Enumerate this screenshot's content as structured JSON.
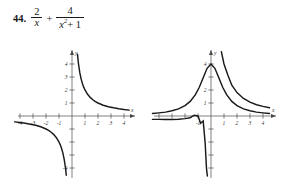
{
  "exercise": {
    "number": "44.",
    "expression_plain": "2/x + 4/(x^2 + 1)",
    "term_one": {
      "numerator": "2",
      "denominator": "x"
    },
    "operator": "+",
    "term_two": {
      "numerator": "4",
      "denominator_base": "x",
      "denominator_exp": "2",
      "denominator_tail": "+ 1"
    }
  },
  "chart_data": [
    {
      "id": "graph-one",
      "type": "line",
      "title": "",
      "xlabel": "x",
      "ylabel": "y",
      "xlim": [
        -4.6,
        4.6
      ],
      "ylim": [
        -4.6,
        4.8
      ],
      "xticks": [
        -4,
        -3,
        -2,
        -1,
        1,
        2,
        3,
        4
      ],
      "yticks": [
        1,
        2,
        3,
        4
      ],
      "xticklabels": [
        "-4",
        "-3",
        "-2",
        "-1",
        "1",
        "2",
        "3",
        "4"
      ],
      "yticklabels": [
        "1",
        "2",
        "3",
        "4"
      ],
      "neg_yticklabels": [
        "-4"
      ],
      "neg_yticks": [
        -4
      ],
      "grid": false,
      "legend": "none",
      "series": [
        {
          "name": "2/x (right branch)",
          "expression": "y = 2/x",
          "x": [
            0.42,
            0.5,
            0.6,
            0.7,
            0.8,
            0.9,
            1.0,
            1.2,
            1.4,
            1.6,
            1.8,
            2.0,
            2.4,
            2.8,
            3.2,
            3.6,
            4.0,
            4.4
          ],
          "y": [
            4.76,
            4.0,
            3.33,
            2.86,
            2.5,
            2.22,
            2.0,
            1.67,
            1.43,
            1.25,
            1.11,
            1.0,
            0.83,
            0.71,
            0.63,
            0.56,
            0.5,
            0.45
          ]
        },
        {
          "name": "2/x (left branch)",
          "expression": "y = 2/x",
          "x": [
            -4.4,
            -4.0,
            -3.6,
            -3.2,
            -2.8,
            -2.4,
            -2.0,
            -1.8,
            -1.6,
            -1.4,
            -1.2,
            -1.0,
            -0.9,
            -0.8,
            -0.7,
            -0.6,
            -0.5,
            -0.44
          ],
          "y": [
            -0.45,
            -0.5,
            -0.56,
            -0.63,
            -0.71,
            -0.83,
            -1.0,
            -1.11,
            -1.25,
            -1.43,
            -1.67,
            -2.0,
            -2.22,
            -2.5,
            -2.86,
            -3.33,
            -4.0,
            -4.55
          ]
        }
      ]
    },
    {
      "id": "graph-two",
      "type": "line",
      "title": "",
      "xlabel": "x",
      "ylabel": "y",
      "xlim": [
        -4.6,
        4.6
      ],
      "ylim": [
        -4.6,
        4.8
      ],
      "xticks": [
        -4,
        -3,
        -2,
        -1,
        1,
        2,
        3,
        4
      ],
      "yticks": [
        1,
        2,
        4
      ],
      "xticklabels": [
        "-1",
        "1",
        "2",
        "3",
        "4"
      ],
      "yticklabels": [
        "1",
        "2",
        "4"
      ],
      "grid": false,
      "legend": "none",
      "series": [
        {
          "name": "4/(x^2+1)",
          "expression": "y = 4/(x^2 + 1)",
          "x": [
            -4.5,
            -4.0,
            -3.5,
            -3.0,
            -2.5,
            -2.0,
            -1.6,
            -1.2,
            -0.9,
            -0.6,
            -0.3,
            0.0,
            0.3,
            0.6,
            0.9,
            1.2,
            1.6,
            2.0,
            2.5,
            3.0,
            3.5,
            4.0,
            4.5
          ],
          "y": [
            0.19,
            0.24,
            0.3,
            0.4,
            0.55,
            0.8,
            1.12,
            1.64,
            2.21,
            2.94,
            3.67,
            4.0,
            3.67,
            2.94,
            2.21,
            1.64,
            1.12,
            0.8,
            0.55,
            0.4,
            0.3,
            0.24,
            0.19
          ]
        },
        {
          "name": "2/x + 4/(x^2+1) (right branch)",
          "expression": "y = 2/x + 4/(x^2 + 1)",
          "x": [
            0.28,
            0.35,
            0.45,
            0.6,
            0.8,
            1.0,
            1.3,
            1.6,
            2.0,
            2.5,
            3.0,
            3.5,
            4.0,
            4.5
          ],
          "y": [
            10.85,
            9.26,
            7.73,
            6.27,
            4.94,
            4.0,
            3.13,
            2.37,
            1.8,
            1.35,
            1.07,
            0.87,
            0.74,
            0.63
          ]
        },
        {
          "name": "2/x + 4/(x^2+1) (left branch)",
          "expression": "y = 2/x + 4/(x^2 + 1)",
          "x": [
            -4.5,
            -4.0,
            -3.5,
            -3.0,
            -2.5,
            -2.0,
            -1.6,
            -1.3,
            -1.0,
            -0.8,
            -0.6,
            -0.45,
            -0.35,
            -0.28
          ],
          "y": [
            -0.26,
            -0.26,
            -0.27,
            -0.27,
            -0.25,
            -0.2,
            -0.13,
            0.06,
            0.0,
            -0.56,
            -0.39,
            -2.06,
            -3.99,
            -6.45
          ]
        }
      ]
    }
  ]
}
